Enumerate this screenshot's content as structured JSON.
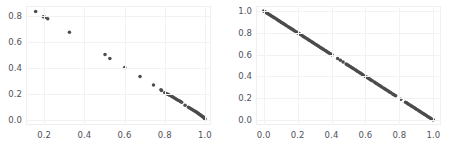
{
  "figure": {
    "width": 458,
    "height": 150,
    "background": "#ffffff",
    "grid_color": "#f2f2f4",
    "marker_color": "#4c4c4c",
    "tick_color": "#50515a",
    "panels": 2
  },
  "chart_data": [
    {
      "type": "scatter",
      "name": "left-panel",
      "title": "",
      "xlabel": "",
      "ylabel": "",
      "xlim": [
        0.11,
        1.03
      ],
      "ylim": [
        -0.04,
        0.88
      ],
      "grid": true,
      "legend": null,
      "xticks": [
        0.2,
        0.4,
        0.6,
        0.8,
        1.0
      ],
      "xtick_labels": [
        "0.2",
        "0.4",
        "0.6",
        "0.8",
        "1.0"
      ],
      "yticks": [
        0.0,
        0.2,
        0.4,
        0.6,
        0.8
      ],
      "ytick_labels": [
        "0.0",
        "0.2",
        "0.4",
        "0.6",
        "0.8"
      ],
      "plot_area_px": {
        "left": 26,
        "top": 6,
        "width": 185,
        "height": 119
      },
      "points": [
        [
          0.158,
          0.838
        ],
        [
          0.196,
          0.797
        ],
        [
          0.205,
          0.793
        ],
        [
          0.218,
          0.782
        ],
        [
          0.326,
          0.677
        ],
        [
          0.503,
          0.506
        ],
        [
          0.527,
          0.474
        ],
        [
          0.601,
          0.404
        ],
        [
          0.677,
          0.334
        ],
        [
          0.744,
          0.269
        ],
        [
          0.781,
          0.233
        ],
        [
          0.784,
          0.227
        ],
        [
          0.8,
          0.209
        ],
        [
          0.806,
          0.203
        ],
        [
          0.812,
          0.199
        ],
        [
          0.818,
          0.196
        ],
        [
          0.824,
          0.19
        ],
        [
          0.83,
          0.186
        ],
        [
          0.836,
          0.18
        ],
        [
          0.842,
          0.174
        ],
        [
          0.848,
          0.169
        ],
        [
          0.854,
          0.163
        ],
        [
          0.86,
          0.158
        ],
        [
          0.866,
          0.152
        ],
        [
          0.872,
          0.147
        ],
        [
          0.878,
          0.141
        ],
        [
          0.884,
          0.136
        ],
        [
          0.901,
          0.113
        ],
        [
          0.918,
          0.097
        ],
        [
          0.924,
          0.091
        ],
        [
          0.93,
          0.086
        ],
        [
          0.936,
          0.08
        ],
        [
          0.942,
          0.075
        ],
        [
          0.948,
          0.069
        ],
        [
          0.954,
          0.064
        ],
        [
          0.958,
          0.059
        ],
        [
          0.962,
          0.055
        ],
        [
          0.966,
          0.05
        ],
        [
          0.97,
          0.046
        ],
        [
          0.974,
          0.041
        ],
        [
          0.978,
          0.037
        ],
        [
          0.982,
          0.032
        ],
        [
          0.986,
          0.028
        ],
        [
          0.99,
          0.023
        ],
        [
          0.993,
          0.019
        ],
        [
          0.996,
          0.014
        ],
        [
          0.998,
          0.01
        ],
        [
          1.0,
          0.006
        ]
      ]
    },
    {
      "type": "scatter",
      "name": "right-panel",
      "title": "",
      "xlabel": "",
      "ylabel": "",
      "xlim": [
        -0.045,
        1.045
      ],
      "ylim": [
        -0.045,
        1.045
      ],
      "grid": true,
      "legend": null,
      "xticks": [
        0.0,
        0.2,
        0.4,
        0.6,
        0.8,
        1.0
      ],
      "xtick_labels": [
        "0.0",
        "0.2",
        "0.4",
        "0.6",
        "0.8",
        "1.0"
      ],
      "yticks": [
        0.0,
        0.2,
        0.4,
        0.6,
        0.8,
        1.0
      ],
      "ytick_labels": [
        "0.0",
        "0.2",
        "0.4",
        "0.6",
        "0.8",
        "1.0"
      ],
      "plot_area_px": {
        "left": 256,
        "top": 6,
        "width": 185,
        "height": 119
      },
      "relationship": "y = 1 - x",
      "points": [
        [
          0.0,
          1.0
        ],
        [
          0.006,
          0.994
        ],
        [
          0.012,
          0.988
        ],
        [
          0.018,
          0.982
        ],
        [
          0.024,
          0.976
        ],
        [
          0.03,
          0.97
        ],
        [
          0.036,
          0.964
        ],
        [
          0.042,
          0.958
        ],
        [
          0.048,
          0.952
        ],
        [
          0.054,
          0.946
        ],
        [
          0.06,
          0.94
        ],
        [
          0.066,
          0.934
        ],
        [
          0.075,
          0.925
        ],
        [
          0.081,
          0.919
        ],
        [
          0.087,
          0.913
        ],
        [
          0.093,
          0.907
        ],
        [
          0.099,
          0.901
        ],
        [
          0.105,
          0.895
        ],
        [
          0.111,
          0.889
        ],
        [
          0.117,
          0.883
        ],
        [
          0.123,
          0.877
        ],
        [
          0.129,
          0.871
        ],
        [
          0.135,
          0.865
        ],
        [
          0.145,
          0.855
        ],
        [
          0.151,
          0.849
        ],
        [
          0.157,
          0.843
        ],
        [
          0.163,
          0.837
        ],
        [
          0.169,
          0.831
        ],
        [
          0.175,
          0.825
        ],
        [
          0.181,
          0.819
        ],
        [
          0.19,
          0.81
        ],
        [
          0.196,
          0.804
        ],
        [
          0.202,
          0.798
        ],
        [
          0.208,
          0.792
        ],
        [
          0.214,
          0.786
        ],
        [
          0.224,
          0.776
        ],
        [
          0.23,
          0.77
        ],
        [
          0.236,
          0.764
        ],
        [
          0.242,
          0.758
        ],
        [
          0.248,
          0.752
        ],
        [
          0.256,
          0.744
        ],
        [
          0.262,
          0.738
        ],
        [
          0.268,
          0.732
        ],
        [
          0.274,
          0.726
        ],
        [
          0.282,
          0.718
        ],
        [
          0.288,
          0.712
        ],
        [
          0.294,
          0.706
        ],
        [
          0.3,
          0.7
        ],
        [
          0.308,
          0.692
        ],
        [
          0.314,
          0.686
        ],
        [
          0.32,
          0.68
        ],
        [
          0.326,
          0.674
        ],
        [
          0.334,
          0.666
        ],
        [
          0.34,
          0.66
        ],
        [
          0.346,
          0.654
        ],
        [
          0.352,
          0.648
        ],
        [
          0.36,
          0.64
        ],
        [
          0.366,
          0.634
        ],
        [
          0.372,
          0.628
        ],
        [
          0.378,
          0.622
        ],
        [
          0.386,
          0.614
        ],
        [
          0.392,
          0.608
        ],
        [
          0.398,
          0.602
        ],
        [
          0.404,
          0.596
        ],
        [
          0.436,
          0.564
        ],
        [
          0.452,
          0.548
        ],
        [
          0.468,
          0.532
        ],
        [
          0.486,
          0.514
        ],
        [
          0.492,
          0.508
        ],
        [
          0.498,
          0.502
        ],
        [
          0.504,
          0.496
        ],
        [
          0.512,
          0.488
        ],
        [
          0.518,
          0.482
        ],
        [
          0.524,
          0.476
        ],
        [
          0.53,
          0.47
        ],
        [
          0.54,
          0.46
        ],
        [
          0.546,
          0.454
        ],
        [
          0.552,
          0.448
        ],
        [
          0.558,
          0.442
        ],
        [
          0.566,
          0.434
        ],
        [
          0.572,
          0.428
        ],
        [
          0.578,
          0.422
        ],
        [
          0.584,
          0.416
        ],
        [
          0.596,
          0.404
        ],
        [
          0.602,
          0.398
        ],
        [
          0.608,
          0.392
        ],
        [
          0.614,
          0.386
        ],
        [
          0.622,
          0.378
        ],
        [
          0.628,
          0.372
        ],
        [
          0.634,
          0.366
        ],
        [
          0.64,
          0.36
        ],
        [
          0.652,
          0.348
        ],
        [
          0.658,
          0.342
        ],
        [
          0.664,
          0.336
        ],
        [
          0.67,
          0.33
        ],
        [
          0.678,
          0.322
        ],
        [
          0.684,
          0.316
        ],
        [
          0.69,
          0.31
        ],
        [
          0.696,
          0.304
        ],
        [
          0.706,
          0.294
        ],
        [
          0.712,
          0.288
        ],
        [
          0.718,
          0.282
        ],
        [
          0.724,
          0.276
        ],
        [
          0.732,
          0.268
        ],
        [
          0.738,
          0.262
        ],
        [
          0.744,
          0.256
        ],
        [
          0.75,
          0.25
        ],
        [
          0.76,
          0.24
        ],
        [
          0.766,
          0.234
        ],
        [
          0.772,
          0.228
        ],
        [
          0.778,
          0.222
        ],
        [
          0.808,
          0.192
        ],
        [
          0.836,
          0.164
        ],
        [
          0.842,
          0.158
        ],
        [
          0.848,
          0.152
        ],
        [
          0.854,
          0.146
        ],
        [
          0.862,
          0.138
        ],
        [
          0.868,
          0.132
        ],
        [
          0.874,
          0.126
        ],
        [
          0.88,
          0.12
        ],
        [
          0.888,
          0.112
        ],
        [
          0.894,
          0.106
        ],
        [
          0.9,
          0.1
        ],
        [
          0.906,
          0.094
        ],
        [
          0.914,
          0.086
        ],
        [
          0.92,
          0.08
        ],
        [
          0.926,
          0.074
        ],
        [
          0.932,
          0.068
        ],
        [
          0.94,
          0.06
        ],
        [
          0.946,
          0.054
        ],
        [
          0.952,
          0.048
        ],
        [
          0.958,
          0.042
        ],
        [
          0.966,
          0.034
        ],
        [
          0.972,
          0.028
        ],
        [
          0.978,
          0.022
        ],
        [
          0.984,
          0.016
        ],
        [
          0.992,
          0.008
        ],
        [
          0.998,
          0.002
        ],
        [
          1.0,
          0.0
        ]
      ]
    }
  ]
}
